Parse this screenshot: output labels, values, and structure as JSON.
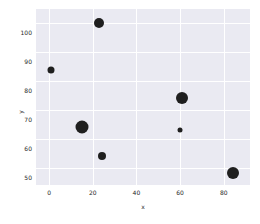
{
  "chart_data": {
    "type": "scatter",
    "title": "",
    "xlabel": "x",
    "ylabel": "y",
    "xlim": [
      -6,
      92
    ],
    "ylim": [
      44,
      105
    ],
    "grid": true,
    "legend": false,
    "xticks": [
      0,
      20,
      40,
      60,
      80
    ],
    "yticks": [
      50,
      60,
      70,
      80,
      90,
      100
    ],
    "marker_color": "#1f1f1f",
    "plot_background": "#eaeaf2",
    "grid_color": "#ffffff",
    "points": [
      {
        "x": 23,
        "y": 100,
        "size": 10
      },
      {
        "x": 1,
        "y": 84,
        "size": 7
      },
      {
        "x": 61,
        "y": 74,
        "size": 12
      },
      {
        "x": 15,
        "y": 64,
        "size": 13
      },
      {
        "x": 60,
        "y": 63,
        "size": 5
      },
      {
        "x": 24,
        "y": 54,
        "size": 8
      },
      {
        "x": 84,
        "y": 48,
        "size": 12
      }
    ]
  }
}
